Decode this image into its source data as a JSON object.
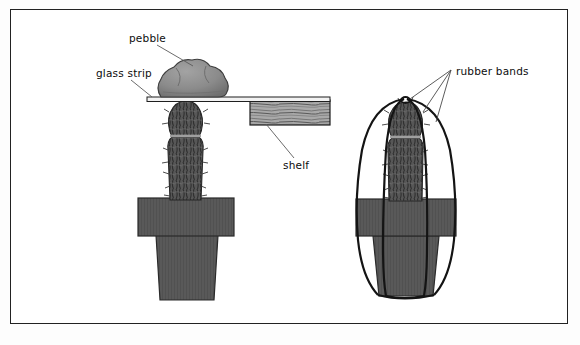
{
  "figure": {
    "background_color": "#ffffff",
    "frame_color": "#222222"
  },
  "labels": {
    "pebble": "pebble",
    "glass_strip": "glass strip",
    "shelf": "shelf",
    "rubber_bands": "rubber bands"
  },
  "colors": {
    "pot_gray": "#595959",
    "pot_rim_gray": "#616161",
    "pebble_gray": "#8a8a8a",
    "cactus_dark": "#4a4a4a",
    "shelf_wood": "#a8a8a8",
    "glass_strip": "#efefef",
    "band_stroke": "#1a1a1a",
    "leader_line": "#555555"
  },
  "scenes": {
    "left": {
      "name": "Cactus with pebble weight on glass strip under shelf",
      "parts": [
        "pebble",
        "glass-strip",
        "shelf",
        "cactus",
        "pot"
      ]
    },
    "right": {
      "name": "Cactus held by rubber bands around pot",
      "parts": [
        "rubber-bands",
        "cactus",
        "pot"
      ]
    }
  }
}
